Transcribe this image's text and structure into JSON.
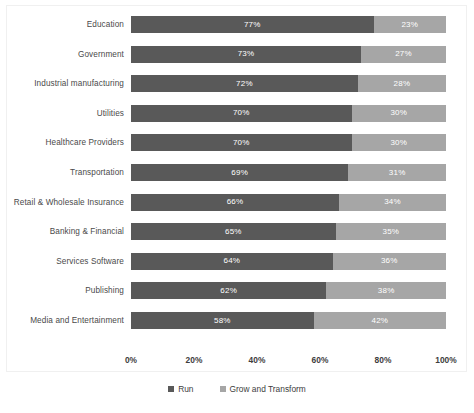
{
  "chart_data": {
    "type": "bar",
    "subtype": "100% stacked horizontal bar",
    "title": "",
    "xlabel": "",
    "ylabel": "",
    "xlim": [
      0,
      100
    ],
    "grid": false,
    "legend_position": "bottom-center",
    "categories": [
      "Education",
      "Government",
      "Industrial manufacturing",
      "Utilities",
      "Healthcare Providers",
      "Transportation",
      "Retail & Wholesale Insurance",
      "Banking  & Financial",
      "Services Software",
      "Publishing",
      "Media and Entertainment"
    ],
    "series": [
      {
        "name": "Run",
        "color": "#595959",
        "values": [
          77,
          73,
          72,
          70,
          70,
          69,
          66,
          65,
          64,
          62,
          58
        ],
        "labels": [
          "77%",
          "73%",
          "72%",
          "70%",
          "70%",
          "69%",
          "66%",
          "65%",
          "64%",
          "62%",
          "58%"
        ]
      },
      {
        "name": "Grow and Transform",
        "color": "#a6a6a6",
        "values": [
          23,
          27,
          28,
          30,
          30,
          31,
          34,
          35,
          36,
          38,
          42
        ],
        "labels": [
          "23%",
          "27%",
          "28%",
          "30%",
          "30%",
          "31%",
          "34%",
          "35%",
          "36%",
          "38%",
          "42%"
        ]
      }
    ],
    "xticks": [
      {
        "value": 0,
        "label": "0%"
      },
      {
        "value": 20,
        "label": "20%"
      },
      {
        "value": 40,
        "label": "40%"
      },
      {
        "value": 60,
        "label": "60%"
      },
      {
        "value": 80,
        "label": "80%"
      },
      {
        "value": 100,
        "label": "100%"
      }
    ],
    "legend": [
      {
        "label": "Run",
        "color": "#595959"
      },
      {
        "label": "Grow and Transform",
        "color": "#a6a6a6"
      }
    ]
  }
}
